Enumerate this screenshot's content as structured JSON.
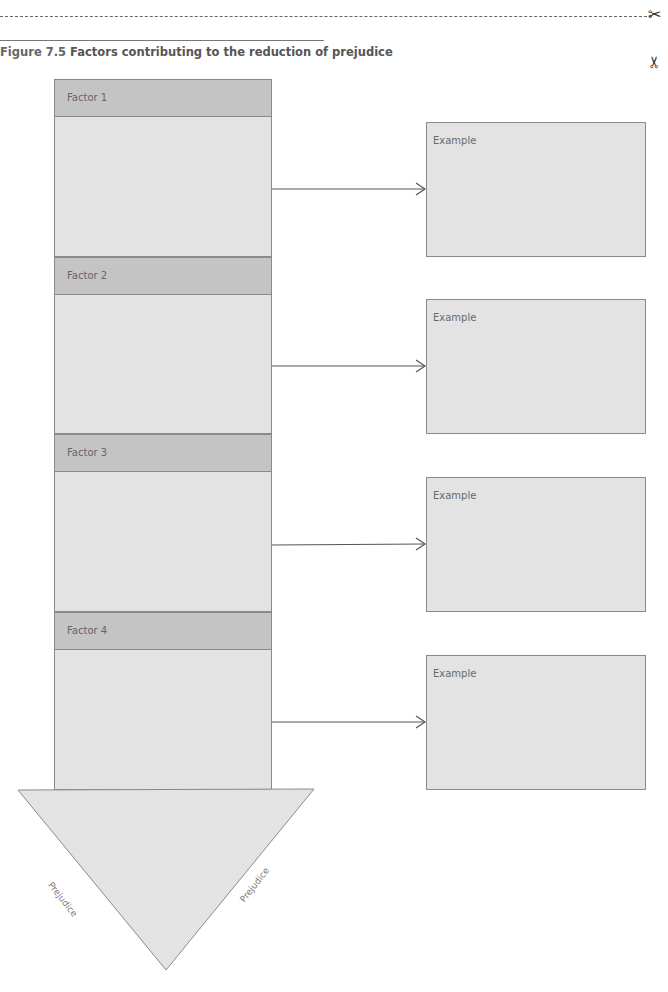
{
  "figure": {
    "number": "Figure 7.5",
    "caption": "Factors contributing to the reduction of prejudice"
  },
  "cut_marks": {
    "top_icon": "scissors-icon",
    "side_icon": "scissors-icon"
  },
  "factors": [
    {
      "label": "Factor 1",
      "example_label": "Example"
    },
    {
      "label": "Factor 2",
      "example_label": "Example"
    },
    {
      "label": "Factor 3",
      "example_label": "Example"
    },
    {
      "label": "Factor 4",
      "example_label": "Example"
    }
  ],
  "arrowhead": {
    "left_label": "Prejudice",
    "right_label": "Prejudice"
  },
  "colors": {
    "header_fill": "#c4c4c4",
    "body_fill": "#e3e3e3",
    "border": "#8a8a8a"
  }
}
